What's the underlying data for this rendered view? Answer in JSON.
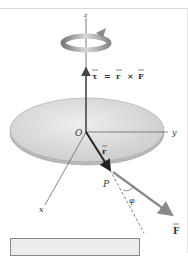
{
  "diagram": {
    "axes": {
      "z": "z",
      "y": "y",
      "x": "x"
    },
    "origin_label": "O",
    "point_label": "P",
    "angle_label": "φ",
    "r_vector_label": "r",
    "force_vector_label": "F",
    "torque_equation": {
      "tau": "τ",
      "equals": "=",
      "r": "r",
      "cross": "×",
      "F": "F"
    },
    "colors": {
      "disk_fill": "#d4d4d4",
      "disk_edge": "#a8a8a8",
      "axis": "#555555",
      "r_vector": "#222222",
      "force_vector": "#8a8a8a",
      "rotation_arrow": "#9a9a9a"
    }
  }
}
